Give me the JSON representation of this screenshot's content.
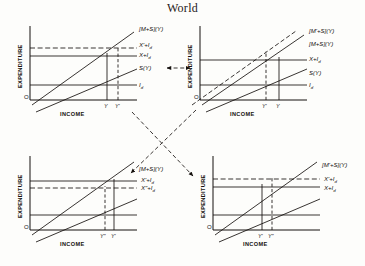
{
  "figure": {
    "title": "World",
    "type": "four-quadrant-economics-diagram",
    "background_color": "#fdfdfb",
    "ink_color": "#15110e"
  },
  "axis_titles": {
    "y": "EXPENDITURE",
    "x": "INCOME",
    "origin": "O"
  },
  "quadrants": [
    {
      "id": "top-left",
      "position": "top-left",
      "curve_labels": [
        {
          "text": "[M+S](Y)",
          "style": "solid",
          "kind": "schedule"
        },
        {
          "text": "X'+I",
          "sub": "d",
          "style": "dashed",
          "kind": "injection"
        },
        {
          "text": "X+I",
          "sub": "d",
          "style": "solid",
          "kind": "injection"
        },
        {
          "text": "S(Y)",
          "style": "solid",
          "kind": "saving"
        },
        {
          "text": "I",
          "sub": "d",
          "style": "solid",
          "kind": "investment"
        }
      ],
      "x_ticks": [
        "Y",
        "Y'"
      ],
      "equilibria": [
        {
          "label": "Y",
          "style": "solid"
        },
        {
          "label": "Y'",
          "style": "dashed"
        }
      ]
    },
    {
      "id": "top-right",
      "position": "top-right",
      "curve_labels": [
        {
          "text": "[M'+S](Y)",
          "style": "dashed",
          "kind": "schedule"
        },
        {
          "text": "[M+S](Y)",
          "style": "solid",
          "kind": "schedule"
        },
        {
          "text": "X+I",
          "sub": "d",
          "style": "solid",
          "kind": "injection"
        },
        {
          "text": "S(Y)",
          "style": "solid",
          "kind": "saving"
        },
        {
          "text": "I",
          "sub": "d",
          "style": "solid",
          "kind": "investment"
        }
      ],
      "x_ticks": [
        "Y'",
        "Y"
      ],
      "equilibria": [
        {
          "label": "Y'",
          "style": "dashed"
        },
        {
          "label": "Y",
          "style": "solid"
        }
      ]
    },
    {
      "id": "bottom-left",
      "position": "bottom-left",
      "curve_labels": [
        {
          "text": "[M+S](Y)",
          "style": "solid",
          "kind": "schedule"
        },
        {
          "text": "X'+I",
          "sub": "d",
          "style": "solid",
          "kind": "injection"
        },
        {
          "text": "X\"+I",
          "sub": "d",
          "style": "dashed",
          "kind": "injection"
        }
      ],
      "x_ticks": [
        "Y\"",
        "Y'"
      ],
      "equilibria": [
        {
          "label": "Y\"",
          "style": "dashed"
        },
        {
          "label": "Y'",
          "style": "solid"
        }
      ]
    },
    {
      "id": "bottom-right",
      "position": "bottom-right",
      "curve_labels": [
        {
          "text": "[M'+S](Y)",
          "style": "solid",
          "kind": "schedule"
        },
        {
          "text": "X'+I",
          "sub": "d",
          "style": "dashed",
          "kind": "injection"
        },
        {
          "text": "X+I",
          "sub": "d",
          "style": "solid",
          "kind": "injection"
        }
      ],
      "x_ticks": [
        "Y'",
        "Y\""
      ],
      "equilibria": [
        {
          "label": "Y'",
          "style": "solid"
        },
        {
          "label": "Y\"",
          "style": "dashed"
        }
      ]
    }
  ],
  "connectors": [
    {
      "id": "horizontal-top",
      "style": "dashed",
      "arrows": "both",
      "from": "top-left",
      "to": "top-right"
    },
    {
      "id": "diagonal-down-left",
      "style": "dashed",
      "arrows": "end",
      "from": "top-right",
      "to": "bottom-left"
    },
    {
      "id": "diagonal-down-right",
      "style": "dashed",
      "arrows": "end",
      "from": "top-left",
      "to": "bottom-right"
    }
  ]
}
